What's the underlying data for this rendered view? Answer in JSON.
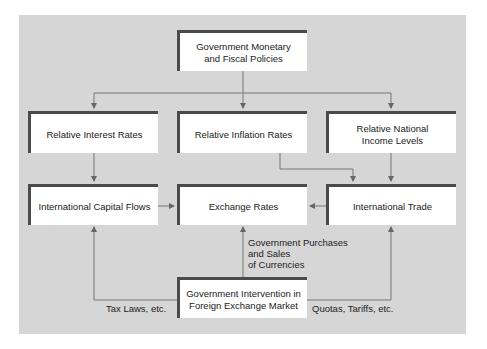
{
  "diagram": {
    "nodes": {
      "policies": "Government Monetary\nand Fiscal Policies",
      "interest": "Relative Interest Rates",
      "inflation": "Relative Inflation Rates",
      "income": "Relative National\nIncome Levels",
      "capital_flows": "International Capital Flows",
      "exchange_rates": "Exchange Rates",
      "trade": "International Trade",
      "intervention": "Government Intervention in\nForeign Exchange Market"
    },
    "edge_labels": {
      "purchases": "Government Purchases\nand Sales\nof Currencies",
      "tax": "Tax Laws, etc.",
      "quotas": "Quotas, Tariffs, etc."
    },
    "colors": {
      "panel": "#d6d6d6",
      "box": "#ffffff",
      "border": "#4a4a4a",
      "line": "#666666"
    }
  }
}
